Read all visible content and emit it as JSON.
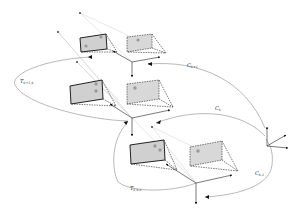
{
  "diagram": {
    "labels": {
      "c_k_plus_1": {
        "main": "C",
        "sub": "k+1"
      },
      "c_k": {
        "main": "C",
        "sub": "k"
      },
      "c_k_minus_1": {
        "main": "C",
        "sub": "k-1"
      },
      "t_k_plus_1_k": {
        "main": "T",
        "sub": "k+1,k"
      },
      "t_k_k_minus_1": {
        "main": "T",
        "sub": "k,k-1"
      }
    },
    "frames": [
      {
        "id": "k+1",
        "origin": [
          132,
          62
        ]
      },
      {
        "id": "k",
        "origin": [
          132,
          118
        ]
      },
      {
        "id": "k-1",
        "origin": [
          196,
          183
        ]
      }
    ],
    "colors": {
      "stroke": "#222222",
      "curve": "#888888",
      "image_fill": "#d0d0d0",
      "dot_fill": "#999999",
      "ray": "#c8c8c8"
    }
  }
}
